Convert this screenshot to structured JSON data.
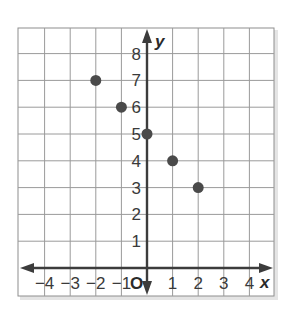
{
  "chart_data": {
    "type": "scatter",
    "title": "",
    "xlabel": "x",
    "ylabel": "y",
    "origin_label": "O",
    "xlim": [
      -5,
      5
    ],
    "ylim": [
      -1,
      9
    ],
    "grid": true,
    "x_ticks": [
      -4,
      -3,
      -2,
      -1,
      1,
      2,
      3,
      4
    ],
    "x_tick_labels": [
      "−4",
      "−3",
      "−2",
      "−1",
      "1",
      "2",
      "3",
      "4"
    ],
    "y_ticks": [
      1,
      2,
      3,
      4,
      5,
      6,
      7,
      8
    ],
    "y_tick_labels": [
      "1",
      "2",
      "3",
      "4",
      "5",
      "6",
      "7",
      "8"
    ],
    "series": [
      {
        "name": "points",
        "points": [
          {
            "x": -2,
            "y": 7
          },
          {
            "x": -1,
            "y": 6
          },
          {
            "x": 0,
            "y": 5
          },
          {
            "x": 1,
            "y": 4
          },
          {
            "x": 2,
            "y": 3
          }
        ]
      }
    ],
    "colors": {
      "grid": "#9a9a9a",
      "axis": "#3c3c3c",
      "point": "#4a4a4a",
      "frame_shadow": "#d8d8d8"
    }
  }
}
